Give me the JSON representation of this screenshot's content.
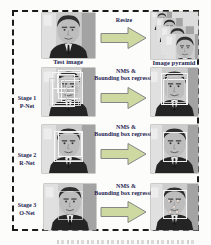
{
  "figure": {
    "top_row": {
      "input_caption": "Test image",
      "arrow_label": "Resize",
      "output_caption": "Image pyramid"
    },
    "stages": [
      {
        "stage_label": "Stage 1",
        "net_label": "P-Net",
        "arrow_label_line1": "NMS &",
        "arrow_label_line2": "Bounding box regression"
      },
      {
        "stage_label": "Stage 2",
        "net_label": "R-Net",
        "arrow_label_line1": "NMS &",
        "arrow_label_line2": "Bounding box regression"
      },
      {
        "stage_label": "Stage 3",
        "net_label": "O-Net",
        "arrow_label_line1": "NMS &",
        "arrow_label_line2": "Bounding box regression"
      }
    ],
    "colors": {
      "arrow_fill": "#cdd9a0",
      "arrow_stroke": "#868686",
      "label_text": "#1d1d52",
      "frame_border": "#1a1a1a"
    }
  }
}
